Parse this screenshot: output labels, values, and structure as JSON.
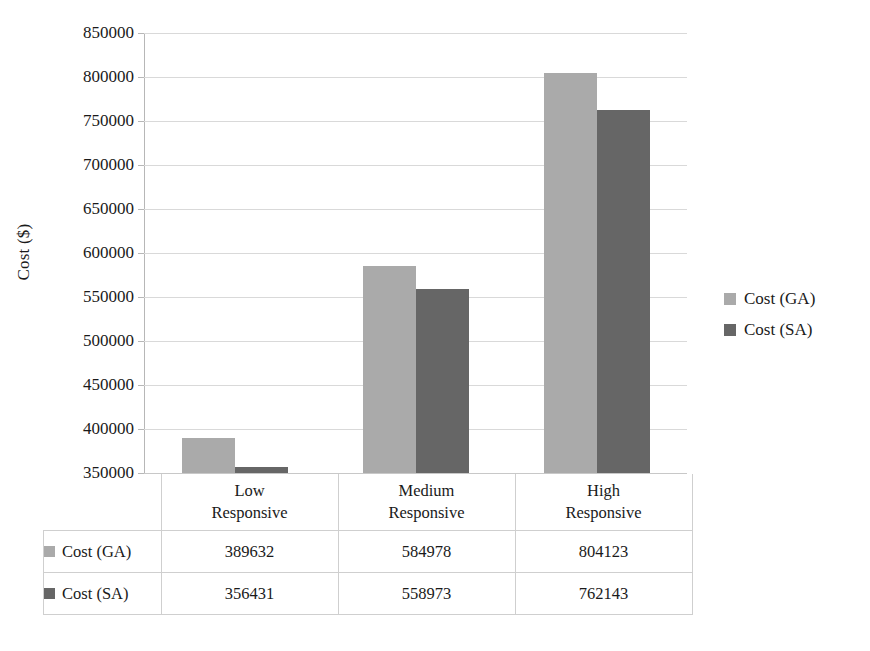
{
  "chart_data": {
    "type": "bar",
    "title": "",
    "subtitle": "",
    "xlabel": "",
    "ylabel": "Cost ($)",
    "categories": [
      "Low Responsive",
      "Medium Responsive",
      "High Responsive"
    ],
    "category_lines": [
      [
        "Low",
        "Responsive"
      ],
      [
        "Medium",
        "Responsive"
      ],
      [
        "High",
        "Responsive"
      ]
    ],
    "series": [
      {
        "name": "Cost (GA)",
        "values": [
          389632,
          584978,
          804123
        ],
        "color": "#aaaaaa"
      },
      {
        "name": "Cost (SA)",
        "values": [
          356431,
          558973,
          762143
        ],
        "color": "#666666"
      }
    ],
    "ylim": [
      350000,
      850000
    ],
    "ytick_step": 50000,
    "yticks": [
      850000,
      800000,
      750000,
      700000,
      650000,
      600000,
      550000,
      500000,
      450000,
      400000,
      350000
    ],
    "ytick_labels": [
      "850000",
      "800000",
      "750000",
      "700000",
      "650000",
      "600000",
      "550000",
      "500000",
      "450000",
      "400000",
      "350000"
    ],
    "grid": true,
    "grid_axis": "y",
    "legend_position": "right",
    "legend_entries": [
      "Cost (GA)",
      "Cost (SA)"
    ],
    "data_table_visible": true
  },
  "axis": {
    "y_title": "Cost ($)"
  },
  "legend": {
    "items": [
      {
        "label": "Cost (GA)",
        "swatch": "ga"
      },
      {
        "label": "Cost (SA)",
        "swatch": "sa"
      }
    ]
  },
  "table": {
    "header": [
      "",
      "Low Responsive",
      "Medium Responsive",
      "High Responsive"
    ],
    "rows": [
      {
        "label": "Cost (GA)",
        "swatch": "ga",
        "cells": [
          "389632",
          "584978",
          "804123"
        ]
      },
      {
        "label": "Cost (SA)",
        "swatch": "sa",
        "cells": [
          "356431",
          "558973",
          "762143"
        ]
      }
    ]
  },
  "colors": {
    "series_ga": "#aaaaaa",
    "series_sa": "#666666",
    "gridline": "#d9d9d9",
    "axis": "#b7b7b7",
    "table_border": "#cfcfcf",
    "background": "#ffffff",
    "text": "#1a1a1a"
  }
}
